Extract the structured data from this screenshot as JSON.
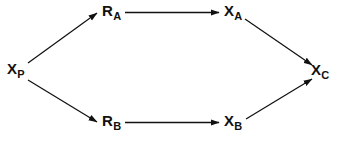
{
  "diagram": {
    "type": "reaction-pathway-graph",
    "background_color": "#ffffff",
    "stroke_color": "#111111",
    "nodes": [
      {
        "id": "xp",
        "base": "X",
        "sub": "P",
        "label": "XP",
        "x": 7,
        "y": 61
      },
      {
        "id": "ra",
        "base": "R",
        "sub": "A",
        "label": "RA",
        "x": 102,
        "y": 3
      },
      {
        "id": "xa",
        "base": "X",
        "sub": "A",
        "label": "XA",
        "x": 224,
        "y": 3
      },
      {
        "id": "xc",
        "base": "X",
        "sub": "C",
        "label": "XC",
        "x": 311,
        "y": 62
      },
      {
        "id": "rb",
        "base": "R",
        "sub": "B",
        "label": "RB",
        "x": 102,
        "y": 113
      },
      {
        "id": "xb",
        "base": "X",
        "sub": "B",
        "label": "XB",
        "x": 224,
        "y": 113
      }
    ],
    "edges": [
      {
        "id": "xp-ra",
        "from": "xp",
        "to": "ra",
        "direction": "up-right"
      },
      {
        "id": "ra-xa",
        "from": "ra",
        "to": "xa",
        "direction": "right"
      },
      {
        "id": "xa-xc",
        "from": "xa",
        "to": "xc",
        "direction": "down-right"
      },
      {
        "id": "xp-rb",
        "from": "xp",
        "to": "rb",
        "direction": "down-right"
      },
      {
        "id": "rb-xb",
        "from": "rb",
        "to": "xb",
        "direction": "right"
      },
      {
        "id": "xb-xc",
        "from": "xb",
        "to": "xc",
        "direction": "up-right"
      }
    ]
  }
}
